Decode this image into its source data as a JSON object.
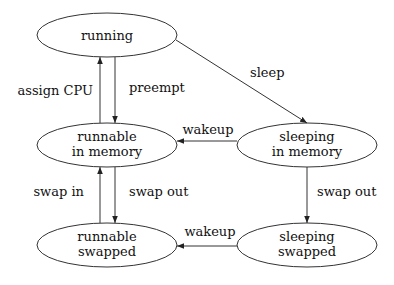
{
  "diagram": {
    "type": "state-transition",
    "nodes": [
      {
        "id": "running",
        "lines": [
          "running"
        ],
        "cx": 107,
        "cy": 35
      },
      {
        "id": "runnable-in-memory",
        "lines": [
          "runnable",
          "in memory"
        ],
        "cx": 107,
        "cy": 145
      },
      {
        "id": "sleeping-in-memory",
        "lines": [
          "sleeping",
          "in memory"
        ],
        "cx": 307,
        "cy": 145
      },
      {
        "id": "runnable-swapped",
        "lines": [
          "runnable",
          "swapped"
        ],
        "cx": 107,
        "cy": 245
      },
      {
        "id": "sleeping-swapped",
        "lines": [
          "sleeping",
          "swapped"
        ],
        "cx": 307,
        "cy": 245
      }
    ],
    "edges": [
      {
        "from": "runnable-in-memory",
        "to": "running",
        "label": "assign CPU"
      },
      {
        "from": "running",
        "to": "runnable-in-memory",
        "label": "preempt"
      },
      {
        "from": "running",
        "to": "sleeping-in-memory",
        "label": "sleep"
      },
      {
        "from": "sleeping-in-memory",
        "to": "runnable-in-memory",
        "label": "wakeup"
      },
      {
        "from": "runnable-swapped",
        "to": "runnable-in-memory",
        "label": "swap in"
      },
      {
        "from": "runnable-in-memory",
        "to": "runnable-swapped",
        "label": "swap out"
      },
      {
        "from": "sleeping-in-memory",
        "to": "sleeping-swapped",
        "label": "swap out"
      },
      {
        "from": "sleeping-swapped",
        "to": "runnable-swapped",
        "label": "wakeup"
      }
    ]
  },
  "colors": {
    "stroke": "#333333",
    "text": "#111111",
    "background": "#ffffff"
  }
}
